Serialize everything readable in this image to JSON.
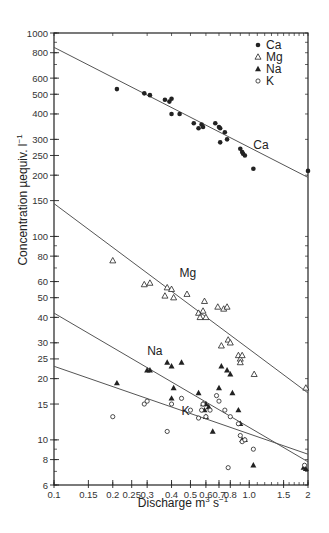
{
  "chart_data": {
    "type": "scatter",
    "title": "",
    "xlabel": "Discharge m³ s⁻¹",
    "ylabel": "Concentration µequiv. l⁻¹",
    "xscale": "log",
    "yscale": "log",
    "xlim": [
      0.1,
      2
    ],
    "ylim": [
      6,
      1000
    ],
    "x_ticks": [
      0.1,
      0.15,
      0.2,
      0.25,
      0.3,
      0.4,
      0.5,
      0.6,
      0.7,
      0.8,
      1.0,
      1.5,
      2
    ],
    "x_tick_labels": [
      "0.1",
      "0.15",
      "0.2",
      "0.25",
      "0.3",
      "0.4",
      "0.5",
      "0.6",
      "0.7",
      "0.8",
      "1.0",
      "1.5",
      "2"
    ],
    "y_ticks": [
      6,
      8,
      10,
      15,
      20,
      25,
      30,
      40,
      50,
      60,
      80,
      100,
      150,
      200,
      250,
      300,
      400,
      500,
      600,
      800,
      1000
    ],
    "y_tick_labels": [
      "6",
      "8",
      "10",
      "15",
      "20",
      "25",
      "30",
      "40",
      "50",
      "60",
      "80",
      "100",
      "150",
      "200",
      "250",
      "300",
      "400",
      "500",
      "600",
      "800",
      "1000"
    ],
    "grid": false,
    "legend_position": "upper right",
    "legend": [
      {
        "name": "Ca",
        "marker": "filled-circle"
      },
      {
        "name": "Mg",
        "marker": "open-triangle"
      },
      {
        "name": "Na",
        "marker": "filled-triangle"
      },
      {
        "name": "K",
        "marker": "open-circle"
      }
    ],
    "series": [
      {
        "name": "Ca",
        "marker": "filled-circle",
        "regression_line": {
          "x": [
            0.1,
            2
          ],
          "y": [
            850,
            195
          ]
        },
        "points": [
          [
            0.21,
            530
          ],
          [
            0.29,
            505
          ],
          [
            0.31,
            495
          ],
          [
            0.37,
            470
          ],
          [
            0.39,
            460
          ],
          [
            0.4,
            475
          ],
          [
            0.4,
            400
          ],
          [
            0.44,
            400
          ],
          [
            0.52,
            360
          ],
          [
            0.55,
            340
          ],
          [
            0.57,
            355
          ],
          [
            0.58,
            345
          ],
          [
            0.67,
            360
          ],
          [
            0.7,
            345
          ],
          [
            0.71,
            340
          ],
          [
            0.71,
            290
          ],
          [
            0.75,
            325
          ],
          [
            0.77,
            300
          ],
          [
            0.9,
            270
          ],
          [
            0.92,
            260
          ],
          [
            0.93,
            255
          ],
          [
            0.95,
            250
          ],
          [
            1.05,
            215
          ],
          [
            2.0,
            210
          ]
        ]
      },
      {
        "name": "Mg",
        "marker": "open-triangle",
        "regression_line": {
          "x": [
            0.1,
            2
          ],
          "y": [
            145,
            17
          ]
        },
        "points": [
          [
            0.2,
            76
          ],
          [
            0.29,
            58
          ],
          [
            0.31,
            59
          ],
          [
            0.37,
            51
          ],
          [
            0.38,
            56
          ],
          [
            0.4,
            55
          ],
          [
            0.41,
            50
          ],
          [
            0.48,
            52
          ],
          [
            0.55,
            42
          ],
          [
            0.56,
            40
          ],
          [
            0.58,
            43
          ],
          [
            0.59,
            48
          ],
          [
            0.6,
            40
          ],
          [
            0.69,
            45
          ],
          [
            0.74,
            44
          ],
          [
            0.77,
            45
          ],
          [
            0.72,
            29
          ],
          [
            0.78,
            31
          ],
          [
            0.8,
            30
          ],
          [
            0.88,
            26
          ],
          [
            0.9,
            25
          ],
          [
            0.9,
            24
          ],
          [
            0.92,
            26
          ],
          [
            1.06,
            21
          ],
          [
            1.95,
            18
          ]
        ]
      },
      {
        "name": "Na",
        "marker": "filled-triangle",
        "regression_line": {
          "x": [
            0.1,
            2
          ],
          "y": [
            42,
            7.8
          ]
        },
        "points": [
          [
            0.21,
            19
          ],
          [
            0.3,
            22
          ],
          [
            0.31,
            22
          ],
          [
            0.38,
            24
          ],
          [
            0.4,
            23
          ],
          [
            0.41,
            18
          ],
          [
            0.45,
            24
          ],
          [
            0.4,
            16
          ],
          [
            0.55,
            17
          ],
          [
            0.58,
            15
          ],
          [
            0.59,
            14
          ],
          [
            0.6,
            15
          ],
          [
            0.6,
            13
          ],
          [
            0.62,
            14.5
          ],
          [
            0.7,
            18
          ],
          [
            0.72,
            23
          ],
          [
            0.77,
            22
          ],
          [
            0.8,
            21
          ],
          [
            0.82,
            17
          ],
          [
            0.88,
            14
          ],
          [
            0.9,
            12
          ],
          [
            0.92,
            10
          ],
          [
            0.95,
            10
          ],
          [
            0.65,
            11
          ],
          [
            1.05,
            7.5
          ],
          [
            1.9,
            7.3
          ],
          [
            1.95,
            7.2
          ]
        ]
      },
      {
        "name": "K",
        "marker": "open-circle",
        "regression_line": {
          "x": [
            0.1,
            2
          ],
          "y": [
            23,
            8.5
          ]
        },
        "points": [
          [
            0.2,
            13
          ],
          [
            0.29,
            15
          ],
          [
            0.3,
            15.5
          ],
          [
            0.38,
            11
          ],
          [
            0.4,
            15
          ],
          [
            0.45,
            16
          ],
          [
            0.5,
            14
          ],
          [
            0.55,
            12.8
          ],
          [
            0.57,
            14
          ],
          [
            0.58,
            15
          ],
          [
            0.6,
            13
          ],
          [
            0.63,
            14
          ],
          [
            0.68,
            16.5
          ],
          [
            0.7,
            15.5
          ],
          [
            0.75,
            14
          ],
          [
            0.8,
            13
          ],
          [
            0.88,
            12
          ],
          [
            0.9,
            10.5
          ],
          [
            0.92,
            9.8
          ],
          [
            0.95,
            10
          ],
          [
            1.05,
            9
          ],
          [
            0.78,
            7.3
          ],
          [
            1.92,
            7.5
          ]
        ]
      }
    ],
    "annotations": [
      {
        "text": "Ca",
        "x": 1.05,
        "y": 270
      },
      {
        "text": "Mg",
        "x": 0.44,
        "y": 63
      },
      {
        "text": "Na",
        "x": 0.3,
        "y": 26
      },
      {
        "text": "K",
        "x": 0.45,
        "y": 13.2
      }
    ]
  },
  "figure": {
    "xlabel_main": "Discharge m",
    "xlabel_sup1": "3",
    "xlabel_mid": " s",
    "xlabel_sup2": "−1",
    "ylabel_main": "Concentration µequiv. l",
    "ylabel_sup": "−1",
    "colors": {
      "ink": "#222222",
      "line": "#555555",
      "background": "#ffffff"
    }
  }
}
